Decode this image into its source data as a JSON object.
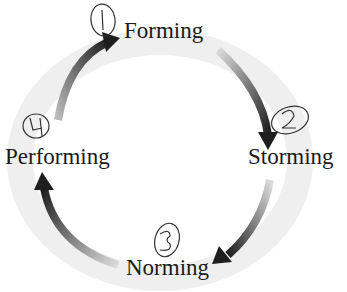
{
  "diagram": {
    "type": "cycle",
    "title": "",
    "stages": [
      {
        "order": 1,
        "label": "Forming",
        "annotation": "1"
      },
      {
        "order": 2,
        "label": "Storming",
        "annotation": "2"
      },
      {
        "order": 3,
        "label": "Norming",
        "annotation": "3"
      },
      {
        "order": 4,
        "label": "Performing",
        "annotation": "4"
      }
    ],
    "flow": [
      "Forming -> Storming",
      "Storming -> Norming",
      "Norming -> Performing",
      "Performing -> Forming"
    ],
    "colors": {
      "arrow_dark": "#1e1e1e",
      "arrow_light": "#d0d0d0",
      "ring": "#efefef",
      "text": "#1a1a1a",
      "handwriting": "#333333"
    }
  }
}
